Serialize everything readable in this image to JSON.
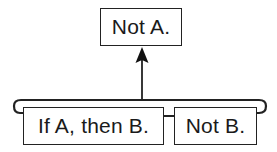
{
  "diagram": {
    "type": "argument-structure",
    "conclusion": {
      "label": "Not A."
    },
    "premises": [
      {
        "label": "If A, then B."
      },
      {
        "label": "Not B."
      }
    ],
    "relation": "premises jointly support conclusion (bracket with arrow upward)",
    "colors": {
      "stroke": "#222222",
      "text": "#1a1a1a",
      "background": "#ffffff"
    }
  }
}
